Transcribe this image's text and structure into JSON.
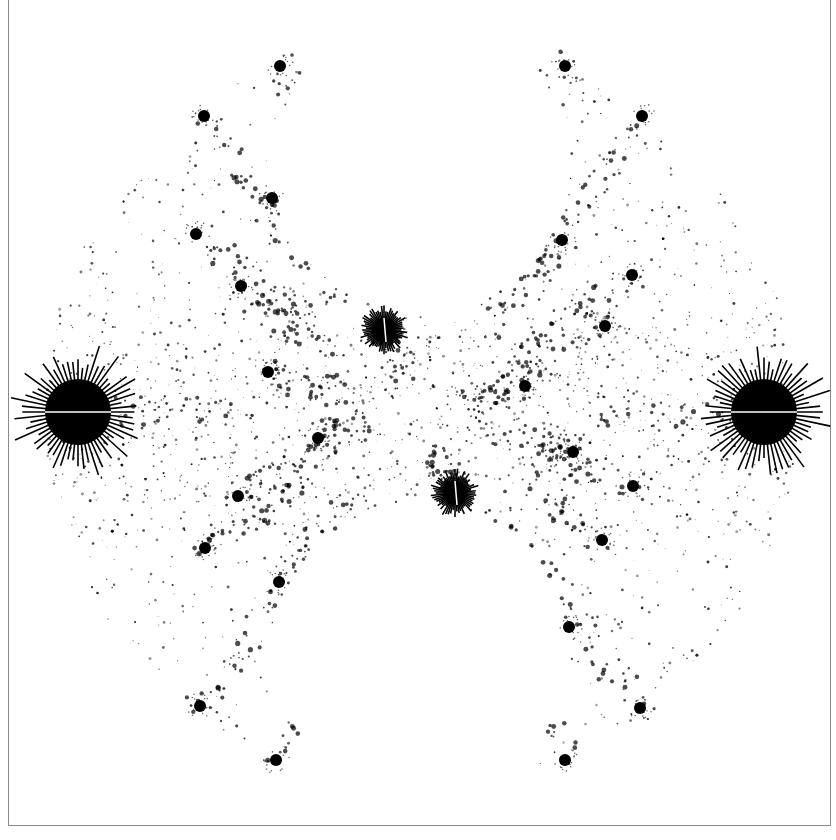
{
  "image": {
    "title": "",
    "description": "Black-on-white fractal limit set inside a circular region",
    "colors": {
      "foreground": "#000000",
      "background": "#ffffff",
      "frame": "#8a8a8a"
    },
    "circle": {
      "cx": 421,
      "cy": 412,
      "r": 376
    },
    "major_blobs": [
      {
        "x": 78,
        "y": 412,
        "r": 33,
        "name": "left-cusp"
      },
      {
        "x": 764,
        "y": 412,
        "r": 33,
        "name": "right-cusp"
      },
      {
        "x": 384,
        "y": 330,
        "r": 12,
        "name": "upper-center"
      },
      {
        "x": 455,
        "y": 493,
        "r": 12,
        "name": "lower-center"
      }
    ],
    "medium_blobs": [
      [
        204,
        116
      ],
      [
        272,
        198
      ],
      [
        196,
        234
      ],
      [
        241,
        286
      ],
      [
        642,
        116
      ],
      [
        562,
        240
      ],
      [
        605,
        326
      ],
      [
        632,
        275
      ],
      [
        200,
        706
      ],
      [
        279,
        582
      ],
      [
        238,
        496
      ],
      [
        205,
        548
      ],
      [
        640,
        708
      ],
      [
        569,
        627
      ],
      [
        602,
        540
      ],
      [
        633,
        486
      ],
      [
        268,
        372
      ],
      [
        318,
        438
      ],
      [
        525,
        386
      ],
      [
        573,
        452
      ],
      [
        280,
        66
      ],
      [
        565,
        66
      ],
      [
        276,
        760
      ],
      [
        565,
        760
      ]
    ],
    "empty_disks": [
      {
        "cx": 421,
        "cy": 165,
        "r": 148
      },
      {
        "cx": 421,
        "cy": 650,
        "r": 148
      }
    ]
  }
}
